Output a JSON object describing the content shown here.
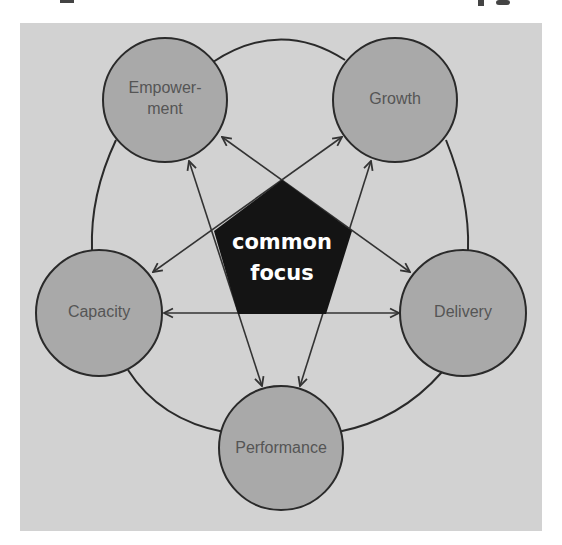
{
  "diagram": {
    "center": {
      "line1": "common",
      "line2": "focus"
    },
    "nodes": [
      {
        "id": "empowerment",
        "line1": "Empower-",
        "line2": "ment"
      },
      {
        "id": "growth",
        "label": "Growth"
      },
      {
        "id": "capacity",
        "label": "Capacity"
      },
      {
        "id": "delivery",
        "label": "Delivery"
      },
      {
        "id": "performance",
        "label": "Performance"
      }
    ],
    "connections": [
      {
        "from": "Capacity",
        "to": "Delivery",
        "type": "bidirectional-arrow"
      },
      {
        "from": "Empowerment",
        "to": "Performance",
        "type": "bidirectional-arrow"
      },
      {
        "from": "Growth",
        "to": "Performance",
        "type": "bidirectional-arrow"
      },
      {
        "from": "Empowerment",
        "to": "Delivery",
        "type": "bidirectional-arrow"
      },
      {
        "from": "Growth",
        "to": "Capacity",
        "type": "bidirectional-arrow"
      },
      {
        "from": "Empowerment",
        "to": "Growth",
        "type": "ring-arc"
      },
      {
        "from": "Growth",
        "to": "Delivery",
        "type": "ring-arc"
      },
      {
        "from": "Delivery",
        "to": "Performance",
        "type": "ring-arc"
      },
      {
        "from": "Performance",
        "to": "Capacity",
        "type": "ring-arc"
      },
      {
        "from": "Capacity",
        "to": "Empowerment",
        "type": "ring-arc"
      }
    ],
    "colors": {
      "background_panel": "#d2d2d2",
      "node_fill": "#a9a9a9",
      "node_stroke": "#2a2a2a",
      "center_fill": "#141414",
      "center_text": "#ffffff",
      "node_text": "#555555"
    }
  }
}
